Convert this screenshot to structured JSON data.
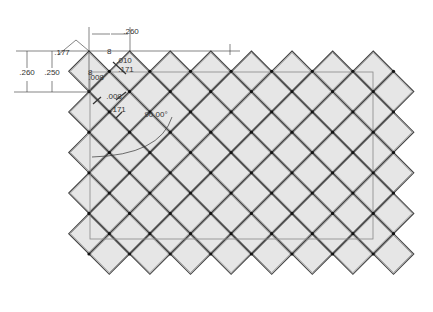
{
  "drawing": {
    "title": "Diamond tile pattern with dimensions",
    "colors": {
      "background": "#ffffff",
      "tile_fill": "#e6e6e6",
      "tile_edge": "#777777",
      "grout": "#444444",
      "node": "#111111",
      "dim_line": "#333333",
      "border": "#888888"
    },
    "grid": {
      "origin_x": 89,
      "origin_y": 51,
      "half_pitch": 20.3,
      "cols": 16,
      "rows": 11,
      "min_x": 68,
      "max_x": 413,
      "min_y": 51,
      "max_y": 281
    },
    "border_rect": {
      "x": 90,
      "y": 72,
      "width": 283,
      "height": 167
    },
    "dimensions": [
      {
        "label": ".260",
        "x": 131,
        "y": 34,
        "orientation": "horizontal"
      },
      {
        "label": ".260",
        "x": 27,
        "y": 75,
        "orientation": "vertical"
      },
      {
        "label": ".250",
        "x": 52,
        "y": 75,
        "orientation": "vertical"
      },
      {
        "label": ".177",
        "x": 62,
        "y": 55,
        "orientation": "angled"
      },
      {
        "label": ".010",
        "x": 124,
        "y": 63,
        "orientation": "angled"
      },
      {
        "label": ".171",
        "x": 126,
        "y": 72,
        "orientation": "angled"
      },
      {
        "label": ".008",
        "x": 96,
        "y": 80,
        "orientation": "angled"
      },
      {
        "label": ".008",
        "x": 114,
        "y": 99,
        "orientation": "angled"
      },
      {
        "label": ".171",
        "x": 118,
        "y": 112,
        "orientation": "angled"
      },
      {
        "label": "90.00°",
        "x": 156,
        "y": 117,
        "orientation": "angle"
      }
    ],
    "markers": [
      {
        "label": "8",
        "x": 107,
        "y": 54
      },
      {
        "label": "8",
        "x": 88,
        "y": 75
      }
    ]
  }
}
